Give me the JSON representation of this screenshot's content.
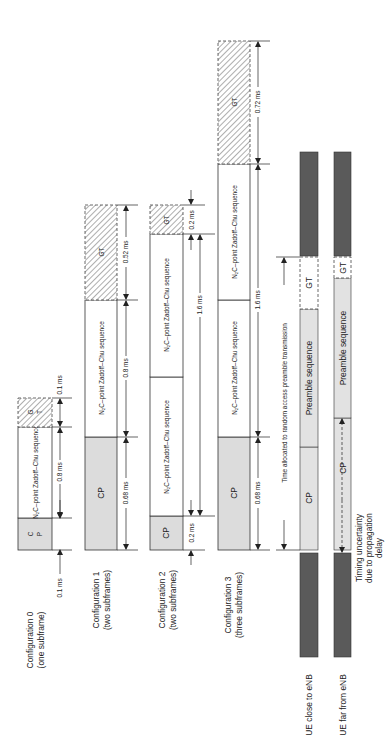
{
  "figure": {
    "orientation": "rotated-90-ccw",
    "colors": {
      "cp_fill": "#dcdcdc",
      "sequence_fill": "#ffffff",
      "ue_dark_fill": "#5a5a5a",
      "ue_light_fill": "#e2e2e2",
      "line": "#222222"
    },
    "configurations": [
      {
        "label_line1": "Configuration 0",
        "label_line2": "(one subframe)",
        "cp_label_a": "C",
        "cp_label_b": "P",
        "sequence_label": "N₂C–point Zadoff–Chu sequence",
        "gt_label_a": "G",
        "gt_label_b": "T",
        "dims": {
          "cp": "0.1 ms",
          "seq": "0.8 ms",
          "gt": "0.1 ms"
        }
      },
      {
        "label_line1": "Configuration 1",
        "label_line2": "(two subframes)",
        "cp_label": "CP",
        "sequence_label": "N₂C–point Zadoff–Chu sequence",
        "gt_label": "GT",
        "dims": {
          "cp": "0.68 ms",
          "seq": "0.8 ms",
          "gt": "0.52 ms"
        }
      },
      {
        "label_line1": "Configuration 2",
        "label_line2": "(two subframes)",
        "cp_label": "CP",
        "sequence_label_1": "N₂C–point Zadoff–Chu sequence",
        "sequence_label_2": "N₂C–point Zadoff–Chu sequence",
        "gt_label": "GT",
        "dims": {
          "cp": "0.2 ms",
          "seq": "1.6 ms",
          "gt": "0.2 ms"
        }
      },
      {
        "label_line1": "Configuration 3",
        "label_line2": "(three subframes)",
        "cp_label": "CP",
        "sequence_label_1": "N₂C–point Zadoff–Chu sequence",
        "sequence_label_2": "N₂C–point Zadoff–Chu sequence",
        "gt_label": "GT",
        "dims": {
          "cp": "0.68 ms",
          "seq": "1.6 ms",
          "gt": "0.72 ms"
        }
      }
    ],
    "timing": {
      "allocated_label": "Time allocated to random access preamble transmission",
      "ue_close": {
        "label": "UE close to eNB",
        "cp_label": "CP",
        "preamble_label": "Preamble sequence",
        "gt_label": "GT"
      },
      "ue_far": {
        "label": "UE far from eNB",
        "cp_label": "CP",
        "preamble_label": "Preamble sequence",
        "gt_label": "GT"
      },
      "uncertainty_line1": "Timing uncertainty",
      "uncertainty_line2": "due to propagation",
      "uncertainty_line3": "delay"
    }
  }
}
